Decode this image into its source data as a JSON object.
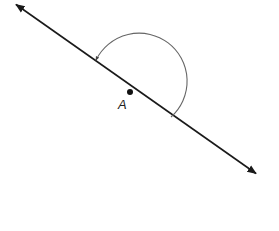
{
  "diagram": {
    "type": "geometry-angle",
    "point": {
      "label": "A",
      "x": 130,
      "y": 92
    },
    "line": {
      "start": {
        "x": 14,
        "y": 3
      },
      "end": {
        "x": 258,
        "y": 175
      },
      "arrows": "both"
    },
    "arc": {
      "center": {
        "x": 130,
        "y": 92
      },
      "radius": 48,
      "from": "lower-right ray",
      "to": "upper-left ray",
      "direction": "counterclockwise over top",
      "arrow_at_end": true
    },
    "colors": {
      "line": "#1a1a1a",
      "arc": "#555555",
      "point": "#111111"
    }
  }
}
